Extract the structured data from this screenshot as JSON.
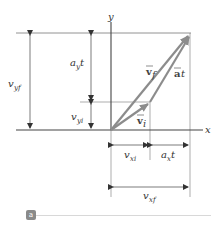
{
  "figure": {
    "axes": {
      "x_label": "x",
      "y_label": "y"
    },
    "vectors": {
      "vf": {
        "symbol": "v",
        "subscript": "f",
        "label": "v⃗f"
      },
      "vi": {
        "symbol": "v",
        "subscript": "i",
        "label": "v⃗i"
      },
      "at": {
        "symbol": "a",
        "suffix": "t",
        "label": "a⃗t"
      }
    },
    "dimensions": {
      "vyf": {
        "main": "v",
        "sub": "yf"
      },
      "ayt": {
        "main": "a",
        "sub": "y",
        "suffix": "t"
      },
      "vyi": {
        "main": "v",
        "sub": "yi"
      },
      "vxi": {
        "main": "v",
        "sub": "xi"
      },
      "axt": {
        "main": "a",
        "sub": "x",
        "suffix": "t"
      },
      "vxf": {
        "main": "v",
        "sub": "xf"
      }
    },
    "badge": "a"
  },
  "colors": {
    "vector": "#8c8c8c",
    "line": "#555555",
    "guide": "#999999"
  }
}
